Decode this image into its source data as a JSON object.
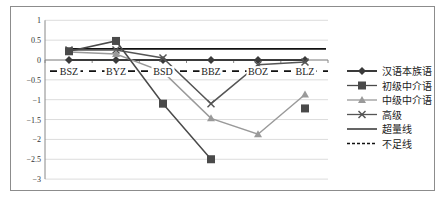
{
  "chart_data": {
    "type": "line",
    "title": "",
    "xlabel": "",
    "ylabel": "",
    "ylim": [
      -3,
      1
    ],
    "yticks": [
      1,
      0.5,
      0,
      -0.5,
      -1,
      -1.5,
      -2,
      -2.5,
      -3
    ],
    "ytick_labels": [
      "1",
      "0.5",
      "0",
      "−0.5",
      "−1",
      "−1.5",
      "−2",
      "−2.5",
      "−3"
    ],
    "grid": true,
    "legend_position": "right",
    "categories": [
      "BSZ",
      "BYZ",
      "BSD",
      "BBZ",
      "BOZ",
      "BLZ"
    ],
    "series": [
      {
        "name": "汉语本族语",
        "marker": "diamond",
        "color": "#3a3a3a",
        "values": [
          0,
          0,
          0,
          0,
          0,
          0
        ]
      },
      {
        "name": "初级中介语",
        "marker": "square",
        "color": "#4a4a4a",
        "values": [
          0.22,
          0.48,
          -1.1,
          -2.5,
          null,
          -1.22
        ]
      },
      {
        "name": "中级中介语",
        "marker": "triangle",
        "color": "#9a9a9a",
        "values": [
          0.2,
          0.15,
          -0.3,
          -1.47,
          -1.87,
          -0.87
        ]
      },
      {
        "name": "高级",
        "marker": "x",
        "color": "#555555",
        "values": [
          0.25,
          0.25,
          0.05,
          -1.1,
          -0.12,
          -0.05
        ]
      },
      {
        "name": "超量线",
        "marker": "none",
        "style": "solid",
        "color": "#111111",
        "values": [
          0.28,
          0.28,
          0.28,
          0.28,
          0.28,
          0.28
        ]
      },
      {
        "name": "不足线",
        "marker": "none",
        "style": "dashed",
        "color": "#111111",
        "values": [
          -0.28,
          -0.28,
          -0.28,
          -0.28,
          -0.28,
          -0.28
        ]
      }
    ]
  },
  "legend": {
    "items": [
      "汉语本族语",
      "初级中介语",
      "中级中介语",
      "高级",
      "超量线",
      "不足线"
    ]
  }
}
